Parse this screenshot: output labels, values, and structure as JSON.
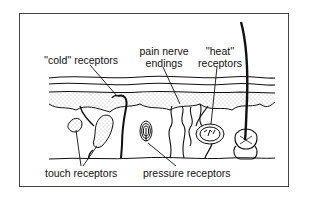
{
  "diagram": {
    "labels": {
      "cold": "''cold'' receptors",
      "pain_line1": "pain nerve",
      "pain_line2": "endings",
      "heat_line1": "''heat''",
      "heat_line2": "receptors",
      "touch": "touch receptors",
      "pressure": "pressure receptors"
    },
    "colors": {
      "ink": "#111111",
      "frame": "#444444",
      "stipple": "#8a8a8a",
      "background": "#ffffff"
    }
  }
}
